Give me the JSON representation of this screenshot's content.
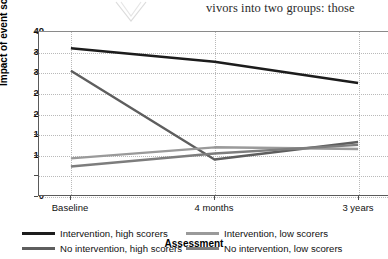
{
  "document_fragment": {
    "top_text": "vivors into two groups: those ",
    "watermark_icon": "double-chevron-mark"
  },
  "chart_data": {
    "type": "line",
    "title": "",
    "xlabel": "Assessment",
    "ylabel": "Impact of event scale",
    "categories": [
      "Baseline",
      "4 months",
      "3 years"
    ],
    "ylim": [
      0,
      40
    ],
    "yticks": [
      0,
      5,
      10,
      15,
      20,
      25,
      30,
      35,
      40
    ],
    "grid": true,
    "legend_position": "bottom",
    "series": [
      {
        "name": "Intervention, high scorers",
        "color": "#1c1c1c",
        "width": 2.6,
        "values": [
          36.0,
          32.7,
          27.5
        ]
      },
      {
        "name": "No intervention, high scorers",
        "color": "#5e5e5e",
        "width": 2.4,
        "values": [
          30.5,
          8.7,
          13.0
        ]
      },
      {
        "name": "Intervention, low scorers",
        "color": "#9a9a9a",
        "width": 2.4,
        "values": [
          9.0,
          11.7,
          11.3
        ]
      },
      {
        "name": "No intervention, low scorers",
        "color": "#7d7d7d",
        "width": 2.4,
        "values": [
          7.0,
          10.2,
          12.3
        ]
      }
    ]
  }
}
